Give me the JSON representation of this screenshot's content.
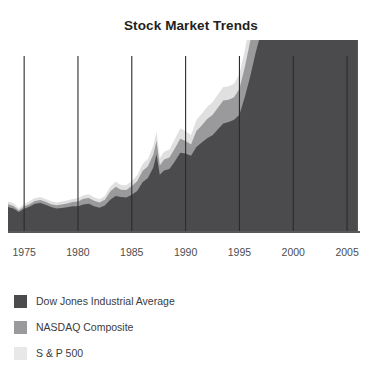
{
  "chart_data": {
    "type": "area",
    "stacked": true,
    "title": "Stock Market Trends",
    "xlabel": "",
    "ylabel": "",
    "grid": "vertical-only",
    "legend_position": "bottom-left",
    "xlim": [
      1973.5,
      2006.2
    ],
    "ylim": [
      0,
      6000
    ],
    "xticks": [
      1975,
      1980,
      1985,
      1990,
      1995,
      2000,
      2005
    ],
    "xticklabels": [
      "1975",
      "1980",
      "1985",
      "1990",
      "1995",
      "2000",
      "2005"
    ],
    "x": [
      1973.5,
      1974,
      1974.5,
      1975,
      1975.5,
      1976,
      1976.5,
      1977,
      1977.5,
      1978,
      1978.5,
      1979,
      1979.5,
      1980,
      1980.5,
      1981,
      1981.5,
      1982,
      1982.5,
      1983,
      1983.5,
      1984,
      1984.5,
      1985,
      1985.5,
      1986,
      1986.5,
      1987,
      1987.3,
      1987.6,
      1988,
      1988.5,
      1989,
      1989.5,
      1990,
      1990.5,
      1991,
      1991.5,
      1992,
      1992.5,
      1993,
      1993.5,
      1994,
      1994.5,
      1995,
      1995.5,
      1996,
      1996.5,
      1997,
      1997.5,
      1998,
      1998.4,
      1998.8,
      1999,
      1999.4,
      1999.8,
      2000,
      2000.2,
      2000.4,
      2000.7,
      2001,
      2001.4,
      2001.8,
      2002,
      2002.4,
      2002.8,
      2003,
      2003.4,
      2003.8,
      2004,
      2004.4,
      2004.8,
      2005,
      2005.4,
      2005.8,
      2006
    ],
    "series": [
      {
        "name": "Dow Jones Industrial Average",
        "color": "#4b4b4d",
        "values": [
          850,
          800,
          680,
          790,
          860,
          960,
          990,
          930,
          850,
          800,
          820,
          840,
          880,
          880,
          940,
          960,
          880,
          830,
          900,
          1100,
          1230,
          1190,
          1180,
          1270,
          1400,
          1700,
          1840,
          2200,
          2650,
          1950,
          2100,
          2150,
          2400,
          2700,
          2680,
          2600,
          2900,
          3050,
          3200,
          3300,
          3500,
          3700,
          3750,
          3830,
          4000,
          4600,
          5300,
          6100,
          6800,
          7900,
          8500,
          8900,
          9100,
          9800,
          10600,
          11200,
          10900,
          10800,
          10400,
          10600,
          10500,
          9800,
          9200,
          9900,
          8800,
          8200,
          8000,
          8900,
          9600,
          10200,
          10300,
          10400,
          10600,
          10500,
          10700,
          10900
        ]
      },
      {
        "name": "NASDAQ Composite",
        "color": "#9a9a9c",
        "values": [
          95,
          88,
          62,
          78,
          90,
          98,
          100,
          97,
          100,
          112,
          118,
          130,
          140,
          160,
          190,
          200,
          185,
          175,
          200,
          280,
          310,
          250,
          250,
          300,
          330,
          380,
          400,
          440,
          450,
          320,
          370,
          390,
          450,
          480,
          420,
          380,
          540,
          580,
          650,
          690,
          740,
          780,
          760,
          760,
          880,
          1020,
          1200,
          1290,
          1450,
          1600,
          1900,
          2100,
          2300,
          3000,
          3800,
          4500,
          4800,
          4300,
          3800,
          3300,
          2400,
          1900,
          1600,
          1800,
          1400,
          1200,
          1300,
          1700,
          1950,
          2050,
          2000,
          2100,
          2150,
          2100,
          2200,
          2280
        ]
      },
      {
        "name": "S & P 500",
        "color": "#e0e0e0",
        "values": [
          95,
          88,
          70,
          86,
          96,
          105,
          107,
          100,
          96,
          94,
          98,
          100,
          105,
          110,
          125,
          130,
          120,
          115,
          130,
          165,
          170,
          160,
          165,
          180,
          200,
          240,
          250,
          300,
          330,
          240,
          265,
          275,
          320,
          350,
          340,
          320,
          380,
          400,
          420,
          435,
          450,
          465,
          460,
          460,
          500,
          580,
          670,
          740,
          850,
          950,
          1050,
          1120,
          1180,
          1300,
          1400,
          1450,
          1450,
          1400,
          1350,
          1350,
          1200,
          1080,
          1000,
          1100,
          900,
          850,
          880,
          1000,
          1080,
          1130,
          1120,
          1180,
          1200,
          1190,
          1220,
          1260
        ]
      }
    ]
  },
  "legend": {
    "items": [
      {
        "label": "Dow Jones Industrial Average",
        "color": "#4b4b4d"
      },
      {
        "label": "NASDAQ Composite",
        "color": "#9a9a9c"
      },
      {
        "label": "S & P 500",
        "color": "#e8e8e8"
      }
    ]
  },
  "axis": {
    "line_color": "#58595b",
    "grid_color": "#2b2b2d"
  }
}
